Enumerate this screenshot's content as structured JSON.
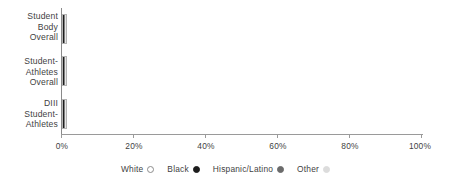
{
  "chart_data": {
    "type": "bar",
    "orientation": "horizontal",
    "stacked": true,
    "percent": true,
    "title": "",
    "subtitle": "",
    "xlabel": "",
    "ylabel": "",
    "xlim": [
      0,
      100
    ],
    "grid": false,
    "legend_position": "bottom-center",
    "categories": [
      "Student\nBody\nOverall",
      "Student-\nAthletes\nOverall",
      "DIII\nStudent-\nAthletes"
    ],
    "x_tick_labels": [
      "0%",
      "20%",
      "40%",
      "60%",
      "80%",
      "100%"
    ],
    "x_ticks": [
      0,
      20,
      40,
      60,
      80,
      100
    ],
    "series": [
      {
        "name": "White",
        "color": "#ffffff",
        "values": [
          54,
          63,
          74
        ]
      },
      {
        "name": "Black",
        "color": "#1c1c1c",
        "values": [
          11,
          17,
          11
        ]
      },
      {
        "name": "Hispanic/Latino",
        "color": "#808080",
        "values": [
          15,
          6,
          5
        ]
      },
      {
        "name": "Other",
        "color": "#e6e6e6",
        "values": [
          20,
          14,
          10
        ]
      }
    ],
    "legend": [
      {
        "label": "White",
        "marker": "open-circle-icon",
        "color": "#ffffff"
      },
      {
        "label": "Black",
        "marker": "filled-circle-dark-icon",
        "color": "#1c1c1c"
      },
      {
        "label": "Hispanic/Latino",
        "marker": "filled-circle-gray-icon",
        "color": "#6b6b6b"
      },
      {
        "label": "Other",
        "marker": "filled-circle-light-icon",
        "color": "#d8d8d8"
      }
    ]
  },
  "axis": {
    "ticks": [
      {
        "label": "0%",
        "value": 0
      },
      {
        "label": "20%",
        "value": 20
      },
      {
        "label": "40%",
        "value": 40
      },
      {
        "label": "60%",
        "value": 60
      },
      {
        "label": "80%",
        "value": 80
      },
      {
        "label": "100%",
        "value": 100
      }
    ]
  },
  "categories": {
    "row0": "Student\nBody\nOverall",
    "row1": "Student-\nAthletes\nOverall",
    "row2": "DIII\nStudent-\nAthletes"
  },
  "legend_labels": {
    "white": "White",
    "black": "Black",
    "hispanic": "Hispanic/Latino",
    "other": "Other"
  }
}
